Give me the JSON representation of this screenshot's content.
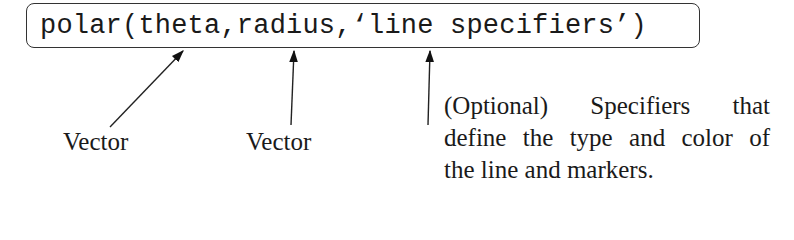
{
  "command": {
    "text": "polar(theta,radius,‘line specifiers’)"
  },
  "annotations": [
    {
      "label": "Vector",
      "target": "theta"
    },
    {
      "label": "Vector",
      "target": "radius"
    },
    {
      "label_lines": [
        "(Optional) Specifiers that",
        "define the type and color of",
        "the line and markers."
      ],
      "target": "line specifiers"
    }
  ],
  "colors": {
    "ink": "#1a1a1a",
    "box_border": "#333333",
    "background": "#ffffff"
  }
}
